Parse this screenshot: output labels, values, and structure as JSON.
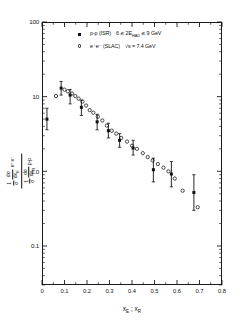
{
  "figure": {
    "axis_titles": {
      "x": "xₑ ; xᴿ",
      "x_parts": {
        "first": "x",
        "first_sub": "E",
        "sep": " ; ",
        "second": "x",
        "second_sub": "R"
      },
      "y_numerator": {
        "prefix": "1",
        "denom": "σ",
        "dnum": "dσ",
        "dden": "dx",
        "dden_sub": "E",
        "tag": "e⁺e⁻"
      },
      "y_denominator": {
        "prefix": "1",
        "denom": "σ",
        "dnum": "dσ",
        "dden": "dx",
        "dden_sub": "R",
        "tag": "p-p"
      }
    },
    "x_axis": {
      "min": 0,
      "max": 0.8,
      "tick_values": [
        0,
        0.1,
        0.2,
        0.3,
        0.4,
        0.5,
        0.6,
        0.7,
        0.8
      ],
      "tick_labels": [
        "0",
        "0.1",
        "0.2",
        "0.3",
        "0.4",
        "0.5",
        "0.6",
        "0.7",
        "0.8"
      ],
      "scale": "linear"
    },
    "y_axis": {
      "scale": "log",
      "min": 0.03,
      "max": 100,
      "decade_labels": [
        "100",
        "10",
        "1.0",
        "0.1"
      ],
      "decade_values": [
        100,
        10,
        1.0,
        0.1
      ]
    },
    "legend": [
      {
        "marker": "filled-square",
        "text_a": "p-p (ISR)",
        "text_b": "6 ≲ 2E",
        "sub_b": "HAD",
        "text_c": " ≲ 9 GeV"
      },
      {
        "marker": "open-circle",
        "text_a": "e⁺e⁻ (SLAC)",
        "text_b": "√s = 7.4 GeV",
        "sub_b": "",
        "text_c": ""
      }
    ]
  },
  "chart_data": {
    "type": "scatter",
    "title": "",
    "xlabel": "x_E ; x_R",
    "ylabel": "[(1/σ)(dσ/dx_E)]_{e+e-} / [(1/σ)(dσ/dx_R)]_{p-p}",
    "xlim": [
      0,
      0.8
    ],
    "ylim": [
      0.03,
      100
    ],
    "yscale": "log",
    "xscale": "linear",
    "grid": false,
    "legend_position": "top-center",
    "series": [
      {
        "name": "p-p (ISR)  6 ≲ 2E_HAD ≲ 9 GeV",
        "marker": "filled-square",
        "color": "#111111",
        "points": [
          {
            "x": 0.022,
            "y": 5.0,
            "yerr_lo": 3.6,
            "yerr_hi": 7.0
          },
          {
            "x": 0.085,
            "y": 13.0,
            "yerr_lo": 10.5,
            "yerr_hi": 16.0
          },
          {
            "x": 0.125,
            "y": 10.5,
            "yerr_lo": 8.0,
            "yerr_hi": 12.5
          },
          {
            "x": 0.175,
            "y": 7.2,
            "yerr_lo": 5.6,
            "yerr_hi": 9.0
          },
          {
            "x": 0.245,
            "y": 4.6,
            "yerr_lo": 3.6,
            "yerr_hi": 5.8
          },
          {
            "x": 0.295,
            "y": 3.5,
            "yerr_lo": 2.8,
            "yerr_hi": 4.4
          },
          {
            "x": 0.345,
            "y": 2.6,
            "yerr_lo": 2.1,
            "yerr_hi": 3.2
          },
          {
            "x": 0.405,
            "y": 2.05,
            "yerr_lo": 1.65,
            "yerr_hi": 2.6
          },
          {
            "x": 0.495,
            "y": 1.05,
            "yerr_lo": 0.72,
            "yerr_hi": 1.5
          },
          {
            "x": 0.575,
            "y": 0.92,
            "yerr_lo": 0.62,
            "yerr_hi": 1.35
          },
          {
            "x": 0.675,
            "y": 0.52,
            "yerr_lo": 0.3,
            "yerr_hi": 0.9
          }
        ]
      },
      {
        "name": "e⁺e⁻ (SLAC)  √s = 7.4 GeV",
        "marker": "open-circle",
        "color": "#111111",
        "points": [
          {
            "x": 0.062,
            "y": 10.2
          },
          {
            "x": 0.1,
            "y": 12.4
          },
          {
            "x": 0.115,
            "y": 11.8
          },
          {
            "x": 0.133,
            "y": 11.0
          },
          {
            "x": 0.148,
            "y": 10.2
          },
          {
            "x": 0.163,
            "y": 9.4
          },
          {
            "x": 0.18,
            "y": 8.6
          },
          {
            "x": 0.196,
            "y": 7.6
          },
          {
            "x": 0.212,
            "y": 6.6
          },
          {
            "x": 0.228,
            "y": 6.1
          },
          {
            "x": 0.248,
            "y": 5.4
          },
          {
            "x": 0.268,
            "y": 4.8
          },
          {
            "x": 0.288,
            "y": 4.1
          },
          {
            "x": 0.31,
            "y": 3.5
          },
          {
            "x": 0.33,
            "y": 3.2
          },
          {
            "x": 0.352,
            "y": 2.8
          },
          {
            "x": 0.378,
            "y": 2.5
          },
          {
            "x": 0.4,
            "y": 2.2
          },
          {
            "x": 0.422,
            "y": 2.0
          },
          {
            "x": 0.448,
            "y": 1.75
          },
          {
            "x": 0.47,
            "y": 1.55
          },
          {
            "x": 0.492,
            "y": 1.4
          },
          {
            "x": 0.515,
            "y": 1.25
          },
          {
            "x": 0.54,
            "y": 1.12
          },
          {
            "x": 0.562,
            "y": 1.0
          },
          {
            "x": 0.59,
            "y": 0.8
          },
          {
            "x": 0.625,
            "y": 0.55
          },
          {
            "x": 0.692,
            "y": 0.33
          }
        ]
      }
    ]
  }
}
